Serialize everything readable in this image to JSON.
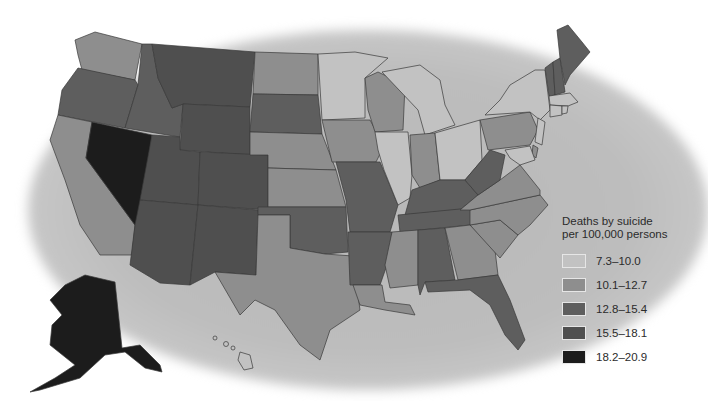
{
  "legend": {
    "title_line1": "Deaths by suicide",
    "title_line2": "per 100,000 persons",
    "items": [
      {
        "label": "7.3–10.0",
        "color": "#c2c2c2"
      },
      {
        "label": "10.1–12.7",
        "color": "#8e8e8e"
      },
      {
        "label": "12.8–15.4",
        "color": "#5e5e5e"
      },
      {
        "label": "15.5–18.1",
        "color": "#4f4f4f"
      },
      {
        "label": "18.2–20.9",
        "color": "#1c1c1c"
      }
    ]
  },
  "map_data": {
    "type": "choropleth",
    "region": "United States",
    "metric": "Deaths by suicide per 100,000 persons",
    "states": {
      "WA": "10.1–12.7",
      "OR": "12.8–15.4",
      "CA": "10.1–12.7",
      "NV": "18.2–20.9",
      "ID": "12.8–15.4",
      "MT": "15.5–18.1",
      "WY": "15.5–18.1",
      "UT": "15.5–18.1",
      "AZ": "15.5–18.1",
      "CO": "15.5–18.1",
      "NM": "15.5–18.1",
      "AK": "18.2–20.9",
      "HI": "7.3–10.0",
      "ND": "10.1–12.7",
      "SD": "12.8–15.4",
      "NE": "10.1–12.7",
      "KS": "10.1–12.7",
      "OK": "12.8–15.4",
      "TX": "10.1–12.7",
      "MN": "7.3–10.0",
      "IA": "10.1–12.7",
      "MO": "12.8–15.4",
      "AR": "12.8–15.4",
      "LA": "10.1–12.7",
      "WI": "10.1–12.7",
      "IL": "7.3–10.0",
      "MI": "7.3–10.0",
      "IN": "10.1–12.7",
      "OH": "7.3–10.0",
      "KY": "12.8–15.4",
      "TN": "12.8–15.4",
      "MS": "10.1–12.7",
      "AL": "12.8–15.4",
      "GA": "10.1–12.7",
      "FL": "12.8–15.4",
      "SC": "10.1–12.7",
      "NC": "10.1–12.7",
      "VA": "10.1–12.7",
      "WV": "12.8–15.4",
      "PA": "10.1–12.7",
      "NY": "7.3–10.0",
      "VT": "12.8–15.4",
      "NH": "12.8–15.4",
      "ME": "12.8–15.4",
      "MA": "7.3–10.0",
      "CT": "7.3–10.0",
      "RI": "7.3–10.0",
      "NJ": "7.3–10.0",
      "DE": "10.1–12.7",
      "MD": "7.3–10.0"
    }
  }
}
